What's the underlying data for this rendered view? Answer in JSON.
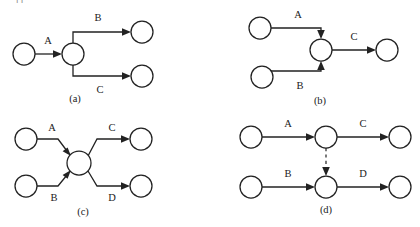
{
  "figure": {
    "top_cut_text": "—件— · ·· ···· ··········",
    "background_color": "#ffffff",
    "line_color": "#222222",
    "node_fill": "#ffffff",
    "diagrams": [
      {
        "id": "a",
        "caption": "(a)",
        "kind": "fork",
        "description": "One activity splits into two parallel branches",
        "nodes": [
          {
            "name": "source",
            "cx": 24,
            "cy": 54,
            "r": 11
          },
          {
            "name": "hub",
            "cx": 73,
            "cy": 54,
            "r": 11
          },
          {
            "name": "target-upper",
            "cx": 142,
            "cy": 32,
            "r": 11
          },
          {
            "name": "target-lower",
            "cx": 142,
            "cy": 76,
            "r": 11
          }
        ],
        "edges": [
          {
            "label": "A",
            "from": "source",
            "to": "hub",
            "style": "solid",
            "label_x": 48,
            "label_y": 44
          },
          {
            "label": "B",
            "from": "hub",
            "to": "target-upper",
            "style": "solid",
            "label_x": 98,
            "label_y": 21
          },
          {
            "label": "C",
            "from": "hub",
            "to": "target-lower",
            "style": "solid",
            "label_x": 100,
            "label_y": 93
          }
        ],
        "caption_x": 75,
        "caption_y": 102
      },
      {
        "id": "b",
        "caption": "(b)",
        "kind": "join",
        "description": "Two parallel branches merge into one activity",
        "nodes": [
          {
            "name": "source-upper",
            "cx": 260,
            "cy": 28,
            "r": 11
          },
          {
            "name": "source-lower",
            "cx": 262,
            "cy": 77,
            "r": 11
          },
          {
            "name": "hub",
            "cx": 321,
            "cy": 50,
            "r": 11
          },
          {
            "name": "target",
            "cx": 387,
            "cy": 50,
            "r": 11
          }
        ],
        "edges": [
          {
            "label": "A",
            "from": "source-upper",
            "to": "hub",
            "style": "solid",
            "label_x": 298,
            "label_y": 18
          },
          {
            "label": "B",
            "from": "source-lower",
            "to": "hub",
            "style": "solid",
            "label_x": 300,
            "label_y": 89
          },
          {
            "label": "C",
            "from": "hub",
            "to": "target",
            "style": "solid",
            "label_x": 354,
            "label_y": 40
          }
        ],
        "caption_x": 320,
        "caption_y": 104
      },
      {
        "id": "c",
        "caption": "(c)",
        "kind": "join-fork",
        "description": "Two branches join at a hub then fork into two branches",
        "nodes": [
          {
            "name": "source-upper",
            "cx": 26,
            "cy": 139,
            "r": 11
          },
          {
            "name": "source-lower",
            "cx": 26,
            "cy": 186,
            "r": 11
          },
          {
            "name": "hub",
            "cx": 79,
            "cy": 163,
            "r": 12
          },
          {
            "name": "target-upper",
            "cx": 141,
            "cy": 139,
            "r": 11
          },
          {
            "name": "target-lower",
            "cx": 141,
            "cy": 186,
            "r": 11
          }
        ],
        "edges": [
          {
            "label": "A",
            "from": "source-upper",
            "to": "hub",
            "style": "solid",
            "label_x": 52,
            "label_y": 131
          },
          {
            "label": "B",
            "from": "source-lower",
            "to": "hub",
            "style": "solid",
            "label_x": 54,
            "label_y": 201
          },
          {
            "label": "C",
            "from": "hub",
            "to": "target-upper",
            "style": "solid",
            "label_x": 112,
            "label_y": 131
          },
          {
            "label": "D",
            "from": "hub",
            "to": "target-lower",
            "style": "solid",
            "label_x": 112,
            "label_y": 201
          }
        ],
        "caption_x": 83,
        "caption_y": 215
      },
      {
        "id": "d",
        "caption": "(d)",
        "kind": "synchronization",
        "description": "Two sequential chains linked by a dashed synchronization arrow",
        "nodes": [
          {
            "name": "source-upper",
            "cx": 251,
            "cy": 137,
            "r": 11
          },
          {
            "name": "hub-upper",
            "cx": 326,
            "cy": 137,
            "r": 11
          },
          {
            "name": "target-upper",
            "cx": 400,
            "cy": 137,
            "r": 11
          },
          {
            "name": "source-lower",
            "cx": 251,
            "cy": 187,
            "r": 11
          },
          {
            "name": "hub-lower",
            "cx": 326,
            "cy": 187,
            "r": 11
          },
          {
            "name": "target-lower",
            "cx": 400,
            "cy": 187,
            "r": 11
          }
        ],
        "edges": [
          {
            "label": "A",
            "from": "source-upper",
            "to": "hub-upper",
            "style": "solid",
            "label_x": 288,
            "label_y": 127
          },
          {
            "label": "C",
            "from": "hub-upper",
            "to": "target-upper",
            "style": "solid",
            "label_x": 363,
            "label_y": 127
          },
          {
            "label": "B",
            "from": "source-lower",
            "to": "hub-lower",
            "style": "solid",
            "label_x": 288,
            "label_y": 177
          },
          {
            "label": "D",
            "from": "hub-lower",
            "to": "target-lower",
            "style": "solid",
            "label_x": 363,
            "label_y": 177
          },
          {
            "label": "",
            "from": "hub-upper",
            "to": "hub-lower",
            "style": "dashed",
            "label_x": 0,
            "label_y": 0
          }
        ],
        "caption_x": 326,
        "caption_y": 213
      }
    ]
  }
}
